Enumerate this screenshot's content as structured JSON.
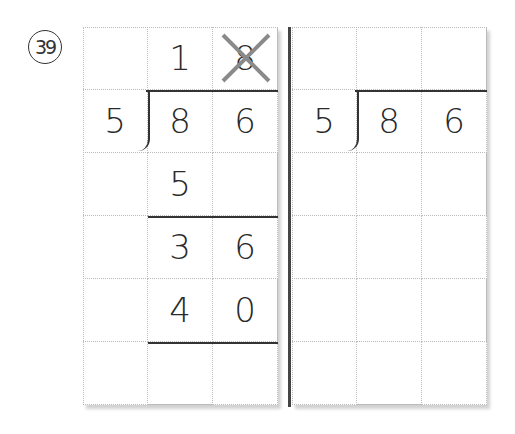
{
  "problem": {
    "number": "39"
  },
  "work_grid": {
    "rows": [
      [
        "",
        "1",
        "8"
      ],
      [
        "5",
        "8",
        "6"
      ],
      [
        "",
        "5",
        ""
      ],
      [
        "",
        "3",
        "6"
      ],
      [
        "",
        "4",
        "0"
      ],
      [
        "",
        "",
        ""
      ]
    ],
    "crossed_out_cell": "row0-col2",
    "cross_color": "#8a8a8a"
  },
  "answer_grid": {
    "rows": [
      [
        "",
        "",
        ""
      ],
      [
        "5",
        "8",
        "6"
      ],
      [
        "",
        "",
        ""
      ],
      [
        "",
        "",
        ""
      ],
      [
        "",
        "",
        ""
      ],
      [
        "",
        "",
        ""
      ]
    ]
  }
}
